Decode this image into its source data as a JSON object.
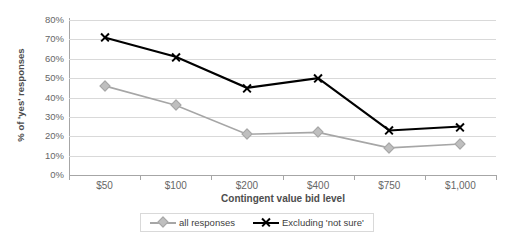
{
  "chart_data": {
    "type": "line",
    "title": "",
    "xlabel": "Contingent value bid level",
    "ylabel": "% of 'yes' responses",
    "categories": [
      "$50",
      "$100",
      "$200",
      "$400",
      "$750",
      "$1,000"
    ],
    "ylim": [
      0,
      80
    ],
    "ytick_labels": [
      "0%",
      "10%",
      "20%",
      "30%",
      "40%",
      "50%",
      "60%",
      "70%",
      "80%"
    ],
    "ytick_values": [
      0,
      10,
      20,
      30,
      40,
      50,
      60,
      70,
      80
    ],
    "grid": true,
    "legend_position": "bottom",
    "series": [
      {
        "name": "all responses",
        "color": "#a6a6a6",
        "marker": "diamond",
        "values": [
          46,
          36,
          21,
          22,
          14,
          16
        ]
      },
      {
        "name": "Excluding 'not sure'",
        "color": "#000000",
        "marker": "x",
        "values": [
          71,
          61,
          45,
          50,
          23,
          25
        ]
      }
    ]
  },
  "axes": {
    "y_title": "% of 'yes' responses",
    "x_title": "Contingent value bid level"
  },
  "legend": {
    "items": [
      {
        "label": "all responses"
      },
      {
        "label": "Excluding 'not sure'"
      }
    ]
  },
  "colors": {
    "series_all_responses": "#a6a6a6",
    "series_excluding_not_sure": "#000000",
    "gridline": "#d9d9d9",
    "axis": "#a6a6a6",
    "text": "#666666",
    "background": "#ffffff"
  }
}
